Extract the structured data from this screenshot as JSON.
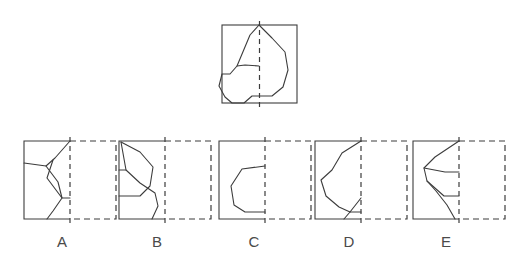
{
  "puzzle": {
    "type": "mirror-symmetry-completion",
    "prompt_figure": {
      "name": "prompt-figure",
      "box": {
        "x": 222,
        "y": 25,
        "width": 75,
        "height": 78
      },
      "mirror_line_x": 259.5,
      "mirror_line_style": "dashed",
      "outline_style": "solid",
      "polyline_points": "259,25 250,35 237,66 230,74 222,74 219,86 225,97 232,103 244,103 252,96 259,96 272,96 283,87 288,70 285,52 272,38 259,25",
      "inner_points": "259,66 245,65 237,66"
    },
    "options": [
      {
        "id": "A",
        "label": "A",
        "name": "option-a",
        "solid_box": {
          "x": 24,
          "y": 141,
          "width": 46,
          "height": 78
        },
        "dashed_box": {
          "x": 70,
          "y": 141,
          "width": 46,
          "height": 78
        },
        "divider_x": 70,
        "divider_style": "dashed",
        "shape_points": "70,141 55,158 46,166 24,163 24,163 45,182 56,198 70,198 60,208 51,219",
        "extra_points": "46,166 57,180 70,198 70,198 56,198"
      },
      {
        "id": "B",
        "label": "B",
        "name": "option-b",
        "solid_box": {
          "x": 119,
          "y": 141,
          "width": 46,
          "height": 78
        },
        "dashed_box": {
          "x": 165,
          "y": 141,
          "width": 46,
          "height": 78
        },
        "divider_x": 165,
        "divider_style": "dashed",
        "shape_points": "165,141 124,143 140,152 153,167 149,185 138,196 119,196 132,210 142,219",
        "extra_points": "124,143 124,170 140,184 152,192 158,205 165,219"
      },
      {
        "id": "C",
        "label": "C",
        "name": "option-c",
        "solid_box": {
          "x": 219,
          "y": 141,
          "width": 46,
          "height": 78
        },
        "dashed_box": {
          "x": 265,
          "y": 141,
          "width": 46,
          "height": 78
        },
        "divider_x": 265,
        "divider_style": "dashed",
        "shape_points": "265,166 240,168 230,184 233,205 244,212 265,212",
        "extra_points": ""
      },
      {
        "id": "D",
        "label": "D",
        "name": "option-d",
        "solid_box": {
          "x": 315,
          "y": 141,
          "width": 46,
          "height": 78
        },
        "dashed_box": {
          "x": 361,
          "y": 141,
          "width": 46,
          "height": 78
        },
        "divider_x": 361,
        "divider_style": "dashed",
        "shape_points": "361,141 340,152 331,170 320,180 325,196 338,208 348,212 361,199 361,199 355,205 344,219",
        "extra_points": "348,212 361,212"
      },
      {
        "id": "E",
        "label": "E",
        "name": "option-e",
        "solid_box": {
          "x": 413,
          "y": 141,
          "width": 46,
          "height": 78
        },
        "dashed_box": {
          "x": 459,
          "y": 141,
          "width": 46,
          "height": 78
        },
        "divider_x": 459,
        "divider_style": "dashed",
        "shape_points": "459,141 432,155 422,166 425,180 433,190 442,204 451,219",
        "extra_points": "422,166 443,170 459,170 459,170 435,186 446,196 459,196"
      }
    ]
  },
  "style": {
    "stroke_color": "#3c3c3c",
    "background_color": "#ffffff",
    "label_color": "#4a4a4a",
    "stroke_width": 1.1
  }
}
